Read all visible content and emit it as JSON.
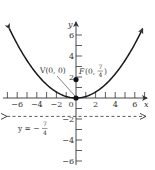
{
  "chart_data": {
    "type": "line",
    "title": "",
    "xlabel": "x",
    "ylabel": "y",
    "xlim": [
      -7,
      7
    ],
    "ylim": [
      -7,
      7
    ],
    "grid": false,
    "x_ticks": [
      -6,
      -4,
      -2,
      0,
      2,
      4,
      6
    ],
    "y_ticks": [
      -6,
      -4,
      -2,
      2,
      4,
      6
    ],
    "x_tick_labels": [
      "−6",
      "−4",
      "−2",
      "0",
      "2",
      "4",
      "6"
    ],
    "y_tick_labels": [
      "−6",
      "−4",
      "−2",
      "2",
      "4",
      "6"
    ],
    "series": [
      {
        "name": "parabola",
        "equation": "x^2 = 7y",
        "style": "solid",
        "arrows": "both-ends",
        "x": [
          -6.8,
          -6,
          -4,
          -2,
          0,
          2,
          4,
          6,
          6.8
        ],
        "y": [
          6.61,
          5.14,
          2.29,
          0.57,
          0,
          0.57,
          2.29,
          5.14,
          6.61
        ]
      },
      {
        "name": "directrix",
        "equation": "y = -7/4",
        "style": "dashed",
        "arrows": "both-ends",
        "x": [
          -7,
          7
        ],
        "y": [
          -1.75,
          -1.75
        ]
      }
    ],
    "points": [
      {
        "name": "vertex",
        "label": "V(0, 0)",
        "x": 0,
        "y": 0
      },
      {
        "name": "focus",
        "label": "F(0, 7/4)",
        "x": 0,
        "y": 1.75
      }
    ],
    "annotations": [
      {
        "text": "V(0, 0)",
        "points_to": "vertex"
      },
      {
        "text": "F(0, 7/4)",
        "points_to": "focus"
      },
      {
        "text": "y = −7/4",
        "describes": "directrix"
      }
    ]
  },
  "labels": {
    "x_axis": "x",
    "y_axis": "y",
    "vertex_label": "V(0, 0)",
    "focus_prefix": "F",
    "focus_open": "(0, ",
    "focus_num": "7",
    "focus_den": "4",
    "focus_close": ")",
    "directrix_prefix": "y = −",
    "directrix_num": "7",
    "directrix_den": "4"
  },
  "colors": {
    "curve": "#1a1a1a",
    "axis": "#333333",
    "text": "#333333",
    "background": "#ffffff"
  }
}
